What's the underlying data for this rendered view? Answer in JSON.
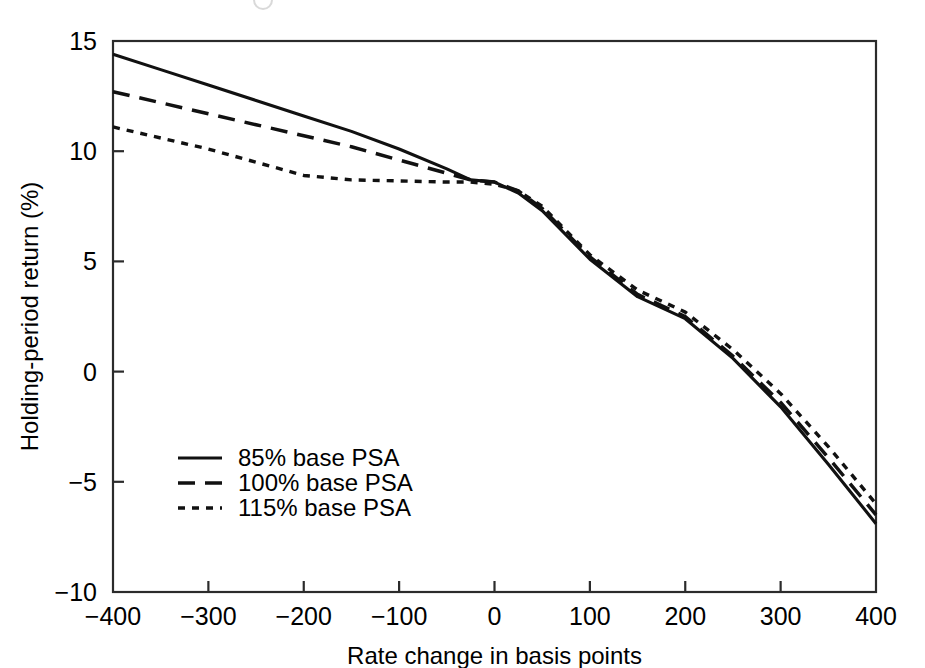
{
  "figure": {
    "name": "holding-period-return-vs-rate-change",
    "background": "#ffffff",
    "ink_color": "#111111"
  },
  "chart_data": {
    "type": "line",
    "title": "",
    "xlabel": "Rate change in basis points",
    "ylabel": "Holding-period return (%)",
    "xlim": [
      -400,
      400
    ],
    "ylim": [
      -10,
      15
    ],
    "xticks": [
      -400,
      -300,
      -200,
      -100,
      0,
      100,
      200,
      300,
      400
    ],
    "xtick_labels": [
      "−400",
      "−300",
      "−200",
      "−100",
      "0",
      "100",
      "200",
      "300",
      "400"
    ],
    "yticks": [
      -10,
      -5,
      0,
      5,
      10,
      15
    ],
    "ytick_labels": [
      "−10",
      "−5",
      "0",
      "5",
      "10",
      "15"
    ],
    "grid": false,
    "legend_position": "lower-left-inside",
    "series": [
      {
        "name": "85% base PSA",
        "style": "solid",
        "x": [
          -400,
          -350,
          -300,
          -250,
          -200,
          -150,
          -100,
          -50,
          -25,
          0,
          25,
          50,
          100,
          150,
          175,
          200,
          250,
          300,
          350,
          400
        ],
        "y": [
          14.4,
          13.7,
          13.0,
          12.3,
          11.6,
          10.9,
          10.1,
          9.2,
          8.7,
          8.6,
          8.1,
          7.3,
          5.1,
          3.4,
          2.9,
          2.4,
          0.6,
          -1.6,
          -4.2,
          -6.9
        ]
      },
      {
        "name": "100% base PSA",
        "style": "dashed",
        "x": [
          -400,
          -350,
          -300,
          -250,
          -200,
          -150,
          -100,
          -50,
          -25,
          0,
          25,
          50,
          100,
          150,
          175,
          200,
          250,
          300,
          350,
          400
        ],
        "y": [
          12.7,
          12.2,
          11.7,
          11.2,
          10.7,
          10.2,
          9.6,
          9.0,
          8.7,
          8.6,
          8.2,
          7.4,
          5.2,
          3.5,
          3.0,
          2.5,
          0.7,
          -1.4,
          -3.9,
          -6.5
        ]
      },
      {
        "name": "115% base PSA",
        "style": "dotted",
        "x": [
          -400,
          -350,
          -300,
          -250,
          -200,
          -150,
          -100,
          -50,
          -25,
          0,
          25,
          50,
          100,
          150,
          175,
          200,
          250,
          300,
          350,
          400
        ],
        "y": [
          11.1,
          10.6,
          10.1,
          9.5,
          8.9,
          8.7,
          8.65,
          8.6,
          8.6,
          8.5,
          8.2,
          7.5,
          5.3,
          3.7,
          3.2,
          2.7,
          1.0,
          -1.0,
          -3.4,
          -6.0
        ]
      }
    ]
  },
  "legend": {
    "entries": [
      {
        "label": "85% base PSA",
        "style": "solid"
      },
      {
        "label": "100% base PSA",
        "style": "dashed"
      },
      {
        "label": "115% base PSA",
        "style": "dotted"
      }
    ]
  }
}
